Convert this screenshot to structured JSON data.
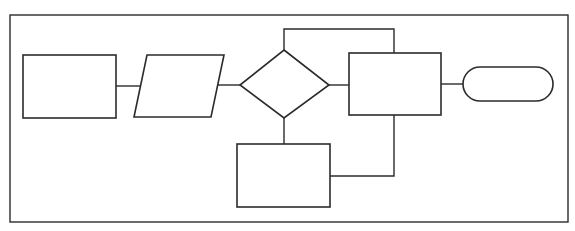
{
  "diagram": {
    "type": "flowchart",
    "colors": {
      "stroke": "#2b2b2b",
      "background": "#ffffff"
    },
    "nodes": [
      {
        "id": "process-start",
        "shape": "rectangle",
        "label": ""
      },
      {
        "id": "input-output",
        "shape": "parallelogram",
        "label": ""
      },
      {
        "id": "decision",
        "shape": "diamond",
        "label": ""
      },
      {
        "id": "process-main",
        "shape": "rectangle",
        "label": ""
      },
      {
        "id": "terminator",
        "shape": "terminator",
        "label": ""
      },
      {
        "id": "process-loop",
        "shape": "rectangle",
        "label": ""
      }
    ],
    "edges": [
      {
        "from": "process-start",
        "to": "input-output"
      },
      {
        "from": "input-output",
        "to": "decision"
      },
      {
        "from": "decision",
        "to": "process-main"
      },
      {
        "from": "process-main",
        "to": "terminator"
      },
      {
        "from": "decision",
        "to": "process-main",
        "route": "top-loop"
      },
      {
        "from": "decision",
        "to": "process-loop"
      },
      {
        "from": "process-loop",
        "to": "process-main",
        "route": "bottom-loop"
      }
    ]
  }
}
